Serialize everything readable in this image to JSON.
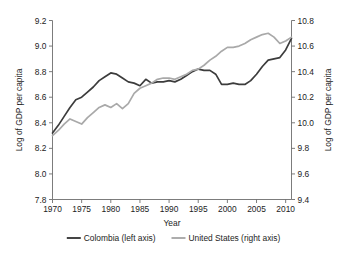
{
  "chart_data": {
    "type": "line",
    "title": "",
    "xlabel": "Year",
    "ylabel": "Log of GDP per capita",
    "ylabel_right": "Log of GDP per capita",
    "grid": false,
    "legend_position": "bottom",
    "xlim": [
      1970,
      2011
    ],
    "ylim": [
      7.8,
      9.2
    ],
    "ylim_right": [
      9.4,
      10.8
    ],
    "xticks": [
      1970,
      1975,
      1980,
      1985,
      1990,
      1995,
      2000,
      2005,
      2010
    ],
    "xtick_labels": [
      "1970",
      "1975",
      "1980",
      "1985",
      "1990",
      "1995",
      "2000",
      "2005",
      "2010"
    ],
    "yticks": [
      7.8,
      8.0,
      8.2,
      8.4,
      8.6,
      8.8,
      9.0,
      9.2
    ],
    "ytick_labels": [
      "7.8",
      "8.0",
      "8.2",
      "8.4",
      "8.6",
      "8.8",
      "9.0",
      "9.2"
    ],
    "yticks_right": [
      9.4,
      9.6,
      9.8,
      10.0,
      10.2,
      10.4,
      10.6,
      10.8
    ],
    "ytick_labels_right": [
      "9.4",
      "9.6",
      "9.8",
      "10.0",
      "10.2",
      "10.4",
      "10.6",
      "10.8"
    ],
    "x": [
      1970,
      1971,
      1972,
      1973,
      1974,
      1975,
      1976,
      1977,
      1978,
      1979,
      1980,
      1981,
      1982,
      1983,
      1984,
      1985,
      1986,
      1987,
      1988,
      1989,
      1990,
      1991,
      1992,
      1993,
      1994,
      1995,
      1996,
      1997,
      1998,
      1999,
      2000,
      2001,
      2002,
      2003,
      2004,
      2005,
      2006,
      2007,
      2008,
      2009,
      2010,
      2011
    ],
    "series": [
      {
        "name": "Colombia (left axis)",
        "axis": "left",
        "color": "#3c3c3c",
        "values": [
          8.32,
          8.38,
          8.45,
          8.52,
          8.58,
          8.6,
          8.64,
          8.68,
          8.73,
          8.76,
          8.79,
          8.78,
          8.75,
          8.72,
          8.71,
          8.69,
          8.74,
          8.71,
          8.72,
          8.72,
          8.73,
          8.72,
          8.74,
          8.77,
          8.8,
          8.82,
          8.81,
          8.81,
          8.78,
          8.7,
          8.7,
          8.71,
          8.7,
          8.7,
          8.73,
          8.78,
          8.84,
          8.89,
          8.9,
          8.91,
          8.97,
          9.06
        ]
      },
      {
        "name": "United States (right axis)",
        "axis": "right",
        "color": "#a9a9a9",
        "values": [
          9.9,
          9.94,
          9.99,
          10.03,
          10.01,
          9.99,
          10.04,
          10.08,
          10.12,
          10.14,
          10.12,
          10.15,
          10.11,
          10.15,
          10.23,
          10.27,
          10.29,
          10.31,
          10.34,
          10.35,
          10.35,
          10.34,
          10.36,
          10.38,
          10.41,
          10.42,
          10.45,
          10.49,
          10.52,
          10.56,
          10.59,
          10.59,
          10.6,
          10.62,
          10.65,
          10.67,
          10.69,
          10.7,
          10.67,
          10.62,
          10.64,
          10.67
        ]
      }
    ],
    "legend": [
      {
        "label": "Colombia (left axis)",
        "color": "#3c3c3c"
      },
      {
        "label": "United States (right axis)",
        "color": "#a9a9a9"
      }
    ]
  }
}
